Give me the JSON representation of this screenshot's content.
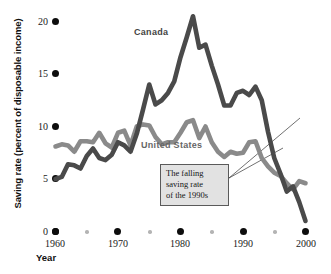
{
  "chart_data": {
    "type": "line",
    "title": "",
    "xlabel": "Year",
    "ylabel": "Saving rate (percent of disposable income)",
    "xlim": [
      1960,
      2000
    ],
    "ylim": [
      0,
      21
    ],
    "grid": false,
    "legend": "inline-labels",
    "xticks": [
      1960,
      1970,
      1980,
      1990,
      2000
    ],
    "xticks_minor": [
      1965,
      1975,
      1985,
      1995
    ],
    "yticks": [
      0,
      5,
      10,
      15,
      20
    ],
    "series": [
      {
        "name": "Canada",
        "color": "#4a4a4a",
        "x": [
          1960,
          1961,
          1962,
          1963,
          1964,
          1965,
          1966,
          1967,
          1968,
          1969,
          1970,
          1971,
          1972,
          1973,
          1974,
          1975,
          1976,
          1977,
          1978,
          1979,
          1980,
          1981,
          1982,
          1983,
          1984,
          1985,
          1986,
          1987,
          1988,
          1989,
          1990,
          1991,
          1992,
          1993,
          1994,
          1995,
          1996,
          1997,
          1998,
          1999,
          2000
        ],
        "values": [
          5.0,
          5.2,
          6.4,
          6.3,
          6.0,
          7.2,
          7.9,
          7.0,
          6.8,
          7.3,
          8.5,
          8.2,
          7.6,
          9.3,
          11.6,
          14.0,
          12.1,
          12.5,
          13.2,
          14.3,
          16.6,
          18.5,
          20.5,
          17.5,
          17.8,
          15.8,
          14.0,
          12.0,
          12.0,
          13.2,
          13.4,
          13.0,
          13.8,
          12.5,
          9.5,
          7.0,
          5.5,
          3.8,
          4.3,
          2.8,
          1.0
        ]
      },
      {
        "name": "United States",
        "color": "#8a8a8a",
        "x": [
          1960,
          1961,
          1962,
          1963,
          1964,
          1965,
          1966,
          1967,
          1968,
          1969,
          1970,
          1971,
          1972,
          1973,
          1974,
          1975,
          1976,
          1977,
          1978,
          1979,
          1980,
          1981,
          1982,
          1983,
          1984,
          1985,
          1986,
          1987,
          1988,
          1989,
          1990,
          1991,
          1992,
          1993,
          1994,
          1995,
          1996,
          1997,
          1998,
          1999,
          2000
        ],
        "values": [
          8.1,
          8.3,
          8.2,
          7.6,
          8.6,
          8.6,
          8.5,
          9.4,
          8.4,
          8.0,
          9.4,
          9.6,
          8.2,
          10.0,
          10.2,
          10.1,
          9.0,
          8.3,
          8.5,
          8.5,
          9.4,
          10.4,
          10.6,
          8.9,
          10.0,
          8.5,
          7.6,
          7.1,
          7.6,
          7.4,
          7.5,
          8.5,
          8.6,
          7.0,
          6.2,
          5.6,
          5.3,
          4.6,
          4.0,
          4.8,
          4.6
        ]
      }
    ],
    "annotations": [
      {
        "name": "falling-saving-rate-callout",
        "lines": [
          "The falling",
          "saving rate",
          "of the 1990s"
        ]
      }
    ]
  },
  "axes": {
    "y_title": "Saving rate (percent of disposable income)",
    "x_title": "Year",
    "y_tick_labels": [
      "20",
      "15",
      "10",
      "5",
      "0"
    ],
    "x_tick_labels": [
      "1960",
      "1970",
      "1980",
      "1990",
      "2000"
    ]
  },
  "series_labels": {
    "canada": "Canada",
    "united_states": "United States"
  },
  "annotation": {
    "line1": "The falling",
    "line2": "saving rate",
    "line3": "of the 1990s"
  },
  "colors": {
    "canada_line": "#4a4a4a",
    "us_line": "#8a8a8a",
    "tick_dot": "#0d0d0d",
    "minor_tick_dot": "#b4b4b4",
    "callout_fill": "#e2e2e2",
    "callout_border": "#5a5a5a"
  }
}
